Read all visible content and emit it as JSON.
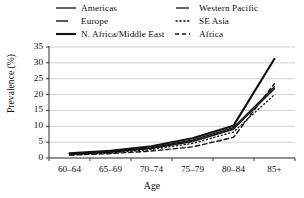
{
  "chart_data": {
    "type": "line",
    "title": "",
    "xlabel": "Age",
    "ylabel": "Prevalence (%)",
    "categories": [
      "60–64",
      "65–69",
      "70–74",
      "75–79",
      "80–84",
      "85+"
    ],
    "ylim": [
      0,
      35
    ],
    "yticks": [
      0,
      5,
      10,
      15,
      20,
      25,
      30,
      35
    ],
    "ytick_labels": [
      "0",
      "5",
      "10",
      "15",
      "20",
      "25",
      "30",
      "35"
    ],
    "grid": true,
    "grid_axis": "y",
    "legend_position": "top",
    "legend_columns": 2,
    "series": [
      {
        "name": "Americas",
        "style": "solid",
        "width": 1.3,
        "color": "#111111",
        "values": [
          1.3,
          2.0,
          3.3,
          5.6,
          9.6,
          22.5
        ]
      },
      {
        "name": "Europe",
        "style": "solid",
        "width": 1.1,
        "color": "#111111",
        "values": [
          1.2,
          1.9,
          3.1,
          5.3,
          9.2,
          21.8
        ]
      },
      {
        "name": "N. Africa/Middle East",
        "style": "solid",
        "width": 2.1,
        "color": "#111111",
        "values": [
          1.5,
          2.3,
          3.7,
          6.2,
          10.2,
          31.3
        ]
      },
      {
        "name": "Western Pacific",
        "style": "solid",
        "width": 1.1,
        "color": "#111111",
        "values": [
          1.1,
          1.8,
          3.0,
          5.1,
          9.0,
          22.0
        ]
      },
      {
        "name": "SE Asia",
        "style": "dotted",
        "width": 1.3,
        "color": "#111111",
        "values": [
          1.0,
          1.6,
          2.7,
          4.6,
          8.2,
          20.0
        ]
      },
      {
        "name": "Africa",
        "style": "dashed",
        "width": 1.4,
        "color": "#111111",
        "values": [
          0.9,
          1.4,
          2.2,
          3.5,
          6.5,
          23.5
        ]
      }
    ]
  },
  "legend": {
    "left_column": [
      {
        "label": "Americas",
        "style": "solid",
        "width": 1.3
      },
      {
        "label": "Europe",
        "style": "solid",
        "width": 1.4
      },
      {
        "label": "N. Africa/Middle East",
        "style": "solid",
        "width": 2.1
      }
    ],
    "right_column": [
      {
        "label": "Western Pacific",
        "style": "solid",
        "width": 1.3
      },
      {
        "label": "SE Asia",
        "style": "dotted",
        "width": 1.4
      },
      {
        "label": "Africa",
        "style": "dashed",
        "width": 1.4
      }
    ]
  },
  "axes": {
    "y_title": "Prevalence (%)",
    "x_title": "Age",
    "y_tick_labels": [
      "35",
      "30",
      "25",
      "20",
      "15",
      "10",
      "5",
      "0"
    ],
    "x_tick_labels": [
      "60–64",
      "65–69",
      "70–74",
      "75–79",
      "80–84",
      "85+"
    ]
  },
  "colors": {
    "line": "#111111",
    "grid": "#b9b9b9",
    "axis": "#3a3a3a",
    "background": "#ffffff"
  }
}
